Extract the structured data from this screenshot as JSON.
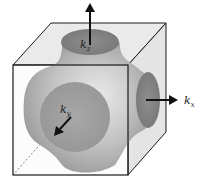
{
  "diagram": {
    "axes": [
      {
        "name": "kz",
        "label": "k",
        "subscript": "z",
        "direction": "up"
      },
      {
        "name": "kx",
        "label": "k",
        "subscript": "x",
        "direction": "right"
      },
      {
        "name": "ky",
        "label": "k",
        "subscript": "y",
        "direction": "toward-viewer"
      }
    ],
    "colors": {
      "cube_face": "#ececec",
      "cube_edge": "#1a1a1a",
      "surface_light": "#d6d6d6",
      "surface_dark": "#7a7a7a",
      "neck_disc": "#858585",
      "arrow": "#111111"
    }
  }
}
